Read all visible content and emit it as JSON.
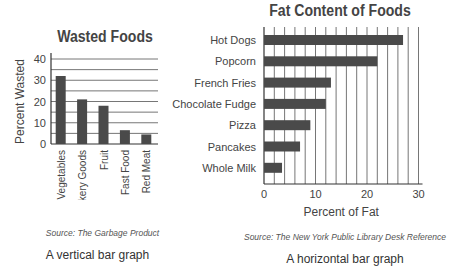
{
  "chart_data": [
    {
      "type": "bar",
      "orientation": "vertical",
      "title": "Wasted Foods",
      "xlabel": "",
      "ylabel": "Percent Wasted",
      "categories": [
        "Vegetables",
        "Bakery Goods",
        "Fruit",
        "Fast Food",
        "Red Meat"
      ],
      "values": [
        32,
        21,
        18,
        6.5,
        4.5
      ],
      "ylim": [
        0,
        40
      ],
      "yticks": [
        0,
        10,
        20,
        30,
        40
      ],
      "grid": "horizontal every 5",
      "source": "Source: The Garbage Product",
      "caption": "A vertical bar graph"
    },
    {
      "type": "bar",
      "orientation": "horizontal",
      "title": "Fat Content of Foods",
      "xlabel": "Percent of Fat",
      "ylabel": "",
      "categories": [
        "Hot Dogs",
        "Popcorn",
        "French Fries",
        "Chocolate Fudge",
        "Pizza",
        "Pancakes",
        "Whole Milk"
      ],
      "values": [
        27,
        22,
        13,
        12,
        9,
        7,
        3.5
      ],
      "xlim": [
        0,
        30
      ],
      "xticks": [
        0,
        10,
        20,
        30
      ],
      "grid": "vertical every 2",
      "source": "Source: The New York Public Library Desk Reference",
      "caption": "A horizontal bar graph"
    }
  ],
  "colors": {
    "bar": "#4a4a4a",
    "grid": "#666666",
    "axis": "#333333",
    "text": "#444444"
  }
}
